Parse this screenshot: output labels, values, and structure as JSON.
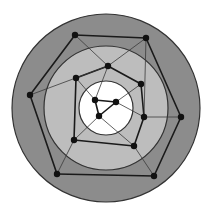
{
  "diagram": {
    "type": "concentric-ring-graph",
    "background": "#ffffff",
    "center": [
      106,
      108
    ],
    "rings": [
      {
        "name": "outer-ring",
        "radius": 94,
        "fill": "#8c8c8c",
        "stroke": "#333333"
      },
      {
        "name": "middle-ring",
        "radius": 62,
        "fill": "#bdbdbd",
        "stroke": "#333333"
      },
      {
        "name": "inner-ring",
        "radius": 27,
        "fill": "#ffffff",
        "stroke": "#333333"
      }
    ],
    "node_color": "#111111",
    "node_radius": 3.2,
    "nodes": [
      {
        "id": "o1",
        "layer": "outer",
        "x": 75,
        "y": 35
      },
      {
        "id": "o2",
        "layer": "outer",
        "x": 146,
        "y": 38
      },
      {
        "id": "o3",
        "layer": "outer",
        "x": 181,
        "y": 117
      },
      {
        "id": "o4",
        "layer": "outer",
        "x": 154,
        "y": 176
      },
      {
        "id": "o5",
        "layer": "outer",
        "x": 57,
        "y": 174
      },
      {
        "id": "o6",
        "layer": "outer",
        "x": 30,
        "y": 95
      },
      {
        "id": "m1",
        "layer": "middle",
        "x": 108,
        "y": 66
      },
      {
        "id": "m2",
        "layer": "middle",
        "x": 141,
        "y": 84
      },
      {
        "id": "m3",
        "layer": "middle",
        "x": 144,
        "y": 117
      },
      {
        "id": "m4",
        "layer": "middle",
        "x": 134,
        "y": 146
      },
      {
        "id": "m5",
        "layer": "middle",
        "x": 74,
        "y": 140
      },
      {
        "id": "m6",
        "layer": "middle",
        "x": 76,
        "y": 78
      },
      {
        "id": "i1",
        "layer": "inner",
        "x": 95,
        "y": 100
      },
      {
        "id": "i2",
        "layer": "inner",
        "x": 116,
        "y": 102
      },
      {
        "id": "i3",
        "layer": "inner",
        "x": 99,
        "y": 116
      }
    ],
    "edges": [
      {
        "from": "o1",
        "to": "o2",
        "weight": "thick"
      },
      {
        "from": "o2",
        "to": "o3",
        "weight": "thick"
      },
      {
        "from": "o3",
        "to": "o4",
        "weight": "thick"
      },
      {
        "from": "o4",
        "to": "o5",
        "weight": "thick"
      },
      {
        "from": "o5",
        "to": "o6",
        "weight": "thick"
      },
      {
        "from": "o6",
        "to": "o1",
        "weight": "thick"
      },
      {
        "from": "m1",
        "to": "m2",
        "weight": "thick"
      },
      {
        "from": "m2",
        "to": "m3",
        "weight": "thick"
      },
      {
        "from": "m3",
        "to": "m4",
        "weight": "thick"
      },
      {
        "from": "m4",
        "to": "m5",
        "weight": "thick"
      },
      {
        "from": "m5",
        "to": "m6",
        "weight": "thick"
      },
      {
        "from": "m6",
        "to": "m1",
        "weight": "thick"
      },
      {
        "from": "i1",
        "to": "i2",
        "weight": "thick"
      },
      {
        "from": "i2",
        "to": "i3",
        "weight": "thick"
      },
      {
        "from": "i3",
        "to": "i1",
        "weight": "thick"
      },
      {
        "from": "o1",
        "to": "m1",
        "weight": "thin"
      },
      {
        "from": "o2",
        "to": "m1",
        "weight": "thin"
      },
      {
        "from": "o2",
        "to": "m3",
        "weight": "thin"
      },
      {
        "from": "o3",
        "to": "m3",
        "weight": "thin"
      },
      {
        "from": "o4",
        "to": "m4",
        "weight": "thin"
      },
      {
        "from": "o5",
        "to": "m5",
        "weight": "thin"
      },
      {
        "from": "o6",
        "to": "m1",
        "weight": "thin"
      },
      {
        "from": "m1",
        "to": "i1",
        "weight": "thin"
      },
      {
        "from": "m2",
        "to": "i2",
        "weight": "thin"
      },
      {
        "from": "m3",
        "to": "i2",
        "weight": "thin"
      },
      {
        "from": "m4",
        "to": "i3",
        "weight": "thin"
      },
      {
        "from": "m5",
        "to": "i3",
        "weight": "thin"
      },
      {
        "from": "m6",
        "to": "i1",
        "weight": "thin"
      }
    ]
  }
}
